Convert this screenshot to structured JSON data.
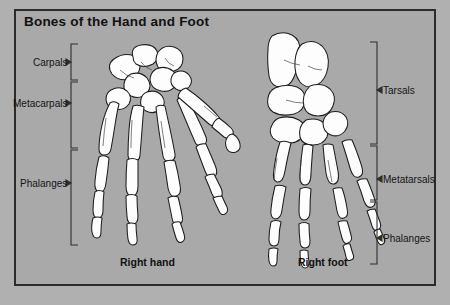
{
  "figure": {
    "title": "Bones of the Hand and Foot",
    "background_color": "#a9a9a9",
    "frame_color": "#2b2b2b",
    "bone_fill": "#fdfdfd",
    "bone_outline": "#1d1d1d"
  },
  "hand": {
    "caption": "Right hand",
    "groups": [
      {
        "label": "Carpals",
        "bracket_side": "left"
      },
      {
        "label": "Metacarpals",
        "bracket_side": "left"
      },
      {
        "label": "Phalanges",
        "bracket_side": "left"
      }
    ]
  },
  "foot": {
    "caption": "Right foot",
    "groups": [
      {
        "label": "Tarsals",
        "bracket_side": "right"
      },
      {
        "label": "Metatarsals",
        "bracket_side": "right"
      },
      {
        "label": "Phalanges",
        "bracket_side": "right"
      }
    ]
  }
}
